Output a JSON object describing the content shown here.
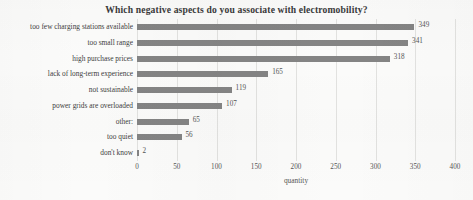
{
  "chart_data": {
    "type": "bar",
    "orientation": "horizontal",
    "title": "Which negative aspects do you associate with electromobility?",
    "xlabel": "quantity",
    "ylabel": "",
    "xlim": [
      0,
      400
    ],
    "xticks": [
      0,
      50,
      100,
      150,
      200,
      250,
      300,
      350,
      400
    ],
    "grid": true,
    "legend": false,
    "bar_color": "#848484",
    "background_color": "#fbfbfa",
    "categories": [
      "too few charging stations available",
      "too small range",
      "high purchase prices",
      "lack of long-term experience",
      "not sustainable",
      "power grids are overloaded",
      "other:",
      "too quiet",
      "don't know"
    ],
    "values": [
      349,
      341,
      318,
      165,
      119,
      107,
      65,
      56,
      2
    ],
    "value_labels": [
      "349",
      "341",
      "318",
      "165",
      "119",
      "107",
      "65",
      "56",
      "2"
    ],
    "tick_labels": [
      "0",
      "50",
      "100",
      "150",
      "200",
      "250",
      "300",
      "350",
      "400"
    ]
  }
}
